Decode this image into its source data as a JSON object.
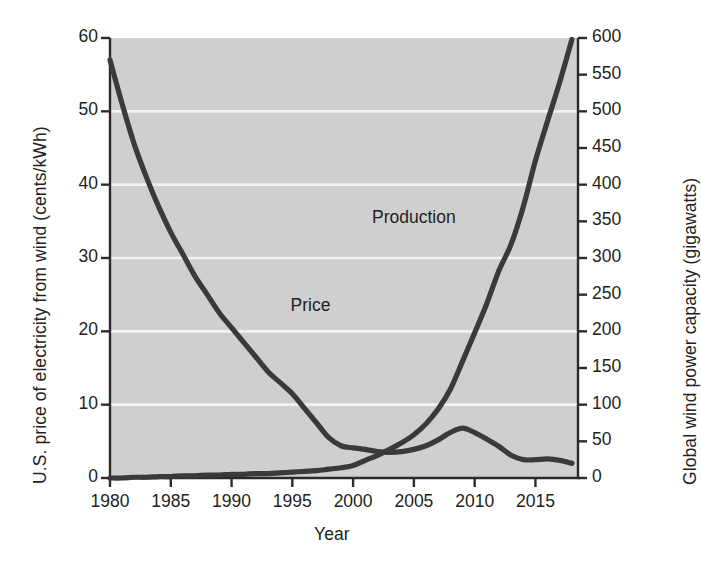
{
  "chart_data": {
    "type": "line",
    "title": "",
    "xlabel": "Year",
    "ylabel": "U.S. price of electricity from wind (cents/kWh)",
    "ylabel_right": "Global wind power capacity (gigawatts)",
    "xlim": [
      1980,
      2018.5
    ],
    "ylim": [
      0,
      60
    ],
    "ylim_right": [
      0,
      600
    ],
    "grid": true,
    "grid_orientation": "horizontal",
    "legend_position": "inline-annotation",
    "xticks": [
      "1980",
      "1985",
      "1990",
      "1995",
      "2000",
      "2005",
      "2010",
      "2015"
    ],
    "xtick_values": [
      1980,
      1985,
      1990,
      1995,
      2000,
      2005,
      2010,
      2015
    ],
    "yticks_left": [
      "0",
      "10",
      "20",
      "30",
      "40",
      "50",
      "60"
    ],
    "ytick_values_left": [
      0,
      10,
      20,
      30,
      40,
      50,
      60
    ],
    "yticks_right": [
      "0",
      "50",
      "100",
      "150",
      "200",
      "250",
      "300",
      "350",
      "400",
      "450",
      "500",
      "550",
      "600"
    ],
    "ytick_values_right": [
      0,
      50,
      100,
      150,
      200,
      250,
      300,
      350,
      400,
      450,
      500,
      550,
      600
    ],
    "series": [
      {
        "name": "Price",
        "axis": "left",
        "units": "cents/kWh",
        "annotation": "Price",
        "annotation_xy": [
          1994.2,
          23.5
        ],
        "x": [
          1980,
          1981,
          1982,
          1983,
          1984,
          1985,
          1986,
          1987,
          1988,
          1989,
          1990,
          1991,
          1992,
          1993,
          1994,
          1995,
          1996,
          1997,
          1998,
          1999,
          2000,
          2001,
          2002,
          2003,
          2004,
          2005,
          2006,
          2007,
          2008,
          2009,
          2010,
          2011,
          2012,
          2013,
          2014,
          2015,
          2016,
          2017,
          2018
        ],
        "values": [
          57.0,
          51.0,
          45.5,
          41.0,
          37.0,
          33.5,
          30.5,
          27.5,
          25.0,
          22.5,
          20.5,
          18.5,
          16.5,
          14.5,
          13.0,
          11.5,
          9.5,
          7.5,
          5.5,
          4.4,
          4.1,
          3.9,
          3.6,
          3.5,
          3.6,
          3.9,
          4.4,
          5.2,
          6.2,
          6.8,
          6.2,
          5.3,
          4.3,
          3.1,
          2.5,
          2.5,
          2.6,
          2.4,
          2.0
        ]
      },
      {
        "name": "Production",
        "axis": "right",
        "units": "gigawatts",
        "annotation": "Production",
        "annotation_xy": [
          2005.5,
          355
        ],
        "x": [
          1980,
          1981,
          1982,
          1983,
          1984,
          1985,
          1986,
          1987,
          1988,
          1989,
          1990,
          1991,
          1992,
          1993,
          1994,
          1995,
          1996,
          1997,
          1998,
          1999,
          2000,
          2001,
          2002,
          2003,
          2004,
          2005,
          2006,
          2007,
          2008,
          2009,
          2010,
          2011,
          2012,
          2013,
          2014,
          2015,
          2016,
          2017,
          2018
        ],
        "values": [
          0,
          0,
          1,
          1,
          2,
          2,
          3,
          3,
          4,
          4,
          5,
          5,
          6,
          6,
          7,
          8,
          9,
          10,
          12,
          14,
          17,
          24,
          31,
          39,
          48,
          59,
          74,
          94,
          121,
          159,
          198,
          238,
          283,
          319,
          370,
          433,
          487,
          540,
          598
        ]
      }
    ],
    "colors": {
      "line": "#3a3a3a",
      "plot_background": "#cfcfcf",
      "gridline": "#f2f2f2",
      "axis": "#2b2b2b",
      "text": "#231f20",
      "page_background": "#ffffff"
    }
  }
}
